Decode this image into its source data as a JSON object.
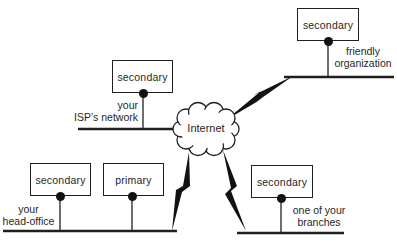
{
  "diagram": {
    "cloud_label": "Internet",
    "servers": [
      {
        "label": "secondary"
      },
      {
        "label": "secondary"
      },
      {
        "label": "secondary"
      },
      {
        "label": "primary"
      },
      {
        "label": "secondary"
      }
    ],
    "network_labels": [
      {
        "line1": "your",
        "line2": "ISP’s network"
      },
      {
        "line1": "friendly",
        "line2": "organization"
      },
      {
        "line1": "your",
        "line2": "head-office"
      },
      {
        "line1": "one of your",
        "line2": "branches"
      }
    ],
    "colors": {
      "ink": "#1f1f1f",
      "background": "#ffffff"
    }
  }
}
